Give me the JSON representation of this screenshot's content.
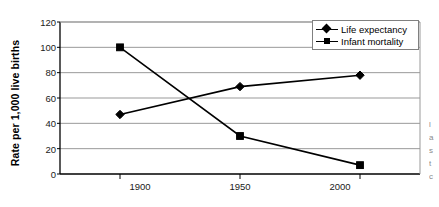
{
  "chart_data": {
    "type": "line",
    "title": "",
    "subtitle": "",
    "xlabel": "",
    "ylabel": "Rate per 1,000 live births",
    "x": [
      1900,
      1950,
      2000
    ],
    "categories": [
      "1900",
      "1950",
      "2000"
    ],
    "series": [
      {
        "name": "Life expectancy",
        "marker": "diamond",
        "color": "#000000",
        "values": [
          47,
          69,
          78
        ]
      },
      {
        "name": "Infant mortality",
        "marker": "square",
        "color": "#000000",
        "values": [
          100,
          30,
          7
        ]
      }
    ],
    "ylim": [
      0,
      120
    ],
    "yticks": [
      0,
      20,
      40,
      60,
      80,
      100,
      120
    ],
    "ytick_labels": [
      "0",
      "20",
      "40",
      "60",
      "80",
      "100",
      "120"
    ],
    "xlim": [
      1875,
      2025
    ],
    "xticks": [
      1900,
      1950,
      2000
    ],
    "xtick_labels": [
      "1900",
      "1950",
      "2000"
    ],
    "grid": "horizontal",
    "grid_color": "#999999",
    "axis_color": "#000000",
    "legend_position": "top-right",
    "legend_border_color": "#808080",
    "plot_background": "#ffffff"
  },
  "legend": {
    "entries": [
      {
        "label": "Life expectancy",
        "marker": "diamond-marker-icon"
      },
      {
        "label": "Infant mortality",
        "marker": "square-marker-icon"
      }
    ]
  },
  "margin_text": {
    "lines": [
      "l",
      "a",
      "s",
      "t",
      "c"
    ]
  }
}
